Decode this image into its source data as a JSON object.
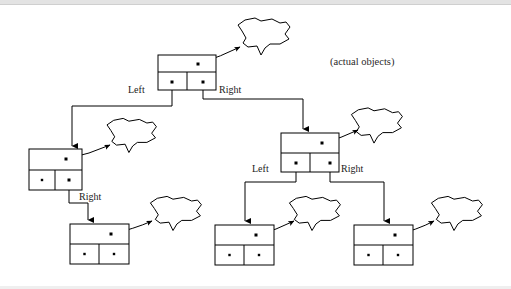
{
  "figure": {
    "caption": "(actual objects)",
    "caption_pos": {
      "x": 330,
      "y": 65
    },
    "colors": {
      "stroke": "#000000",
      "fill": "#ffffff",
      "text": "#1a1a1a",
      "caption": "#2a2a2a",
      "background": "#ffffff"
    },
    "pointer_labels": [
      {
        "id": "root-left",
        "text": "Left",
        "x": 128,
        "y": 93
      },
      {
        "id": "root-right",
        "text": "Right",
        "x": 219,
        "y": 93
      },
      {
        "id": "n2-right",
        "text": "Right",
        "x": 79,
        "y": 200
      },
      {
        "id": "n3-left",
        "text": "Left",
        "x": 252,
        "y": 172
      },
      {
        "id": "n3-right",
        "text": "Right",
        "x": 341,
        "y": 172
      }
    ],
    "nodes": [
      {
        "id": "root",
        "name": "root-node",
        "x": 158,
        "y": 55,
        "w": 58,
        "h": 35,
        "split_y": 72,
        "mid_x": 187,
        "data_dot": {
          "x": 198,
          "y": 64
        },
        "left_dot": {
          "x": 172,
          "y": 82
        },
        "right_dot": {
          "x": 203,
          "y": 82
        },
        "has_left_child": true,
        "has_right_child": true,
        "cells": [
          "",
          ""
        ]
      },
      {
        "id": "n2",
        "name": "left-child-node",
        "x": 29,
        "y": 149,
        "w": 53,
        "h": 41,
        "split_y": 170,
        "mid_x": 55,
        "data_dot": {
          "x": 66,
          "y": 159
        },
        "left_dot": {
          "x": 42,
          "y": 180
        },
        "right_dot": {
          "x": 69,
          "y": 180
        },
        "has_left_child": false,
        "has_right_child": true,
        "cells": [
          "null",
          ""
        ]
      },
      {
        "id": "n3",
        "name": "right-child-node",
        "x": 281,
        "y": 133,
        "w": 58,
        "h": 39,
        "split_y": 153,
        "mid_x": 310,
        "data_dot": {
          "x": 322,
          "y": 143
        },
        "left_dot": {
          "x": 296,
          "y": 163
        },
        "right_dot": {
          "x": 330,
          "y": 163
        },
        "has_left_child": true,
        "has_right_child": true,
        "cells": [
          "",
          ""
        ]
      },
      {
        "id": "n4",
        "name": "leaf-node-left",
        "x": 70,
        "y": 224,
        "w": 59,
        "h": 40,
        "split_y": 244,
        "mid_x": 99,
        "data_dot": {
          "x": 111,
          "y": 234
        },
        "left_dot": null,
        "right_dot": null,
        "has_left_child": false,
        "has_right_child": false,
        "cells": [
          "null",
          "null"
        ]
      },
      {
        "id": "n5",
        "name": "leaf-node-middle",
        "x": 215,
        "y": 225,
        "w": 59,
        "h": 40,
        "split_y": 245,
        "mid_x": 244,
        "data_dot": {
          "x": 256,
          "y": 235
        },
        "left_dot": null,
        "right_dot": null,
        "has_left_child": false,
        "has_right_child": false,
        "cells": [
          "null",
          "null"
        ]
      },
      {
        "id": "n6",
        "name": "leaf-node-right",
        "x": 354,
        "y": 225,
        "w": 59,
        "h": 40,
        "split_y": 245,
        "mid_x": 383,
        "data_dot": {
          "x": 395,
          "y": 235
        },
        "left_dot": null,
        "right_dot": null,
        "has_left_child": false,
        "has_right_child": false,
        "cells": [
          "null",
          "null"
        ]
      }
    ],
    "blobs": [
      {
        "id": "blob-root",
        "name": "object-blob-root",
        "cx": 259,
        "cy": 36,
        "sx": 1.0,
        "sy": 1.0
      },
      {
        "id": "blob-n2",
        "name": "object-blob-left-child",
        "cx": 127,
        "cy": 135,
        "sx": 0.95,
        "sy": 0.92
      },
      {
        "id": "blob-n3",
        "name": "object-blob-right-child",
        "cx": 372,
        "cy": 125,
        "sx": 0.98,
        "sy": 0.95
      },
      {
        "id": "blob-n4",
        "name": "object-blob-leaf-left",
        "cx": 171,
        "cy": 213,
        "sx": 0.98,
        "sy": 0.92
      },
      {
        "id": "blob-n5",
        "name": "object-blob-leaf-middle",
        "cx": 310,
        "cy": 213,
        "sx": 0.98,
        "sy": 0.92
      },
      {
        "id": "blob-n6",
        "name": "object-blob-leaf-right",
        "cx": 452,
        "cy": 213,
        "sx": 0.98,
        "sy": 0.92
      }
    ],
    "edges": [
      {
        "id": "e-root-left",
        "name": "edge-root-to-left-child",
        "points": "172,82 172,106 72,106 72,146"
      },
      {
        "id": "e-root-right",
        "name": "edge-root-to-right-child",
        "points": "203,82 203,99 303,99 303,129"
      },
      {
        "id": "e-n2-right",
        "name": "edge-left-child-to-leaf",
        "points": "69,180 69,203 88,203 88,220"
      },
      {
        "id": "e-n3-left",
        "name": "edge-right-child-to-leaf-middle",
        "points": "296,163 296,182 245,182 245,221"
      },
      {
        "id": "e-n3-right",
        "name": "edge-right-child-to-leaf-right",
        "points": "330,163 330,182 384,182 384,221"
      }
    ],
    "object_arrows": [
      {
        "id": "a-root",
        "name": "arrow-root-to-object",
        "from": [
          198,
          64
        ],
        "ctrl": [
          222,
          56
        ],
        "to": [
          240,
          47
        ]
      },
      {
        "id": "a-n2",
        "name": "arrow-left-child-to-object",
        "from": [
          66,
          159
        ],
        "ctrl": [
          90,
          154
        ],
        "to": [
          110,
          145
        ]
      },
      {
        "id": "a-n3",
        "name": "arrow-right-child-to-object",
        "from": [
          322,
          143
        ],
        "ctrl": [
          342,
          138
        ],
        "to": [
          358,
          130
        ]
      },
      {
        "id": "a-n4",
        "name": "arrow-leaf-left-to-object",
        "from": [
          111,
          234
        ],
        "ctrl": [
          134,
          229
        ],
        "to": [
          152,
          221
        ]
      },
      {
        "id": "a-n5",
        "name": "arrow-leaf-middle-to-object",
        "from": [
          256,
          235
        ],
        "ctrl": [
          277,
          230
        ],
        "to": [
          294,
          221
        ]
      },
      {
        "id": "a-n6",
        "name": "arrow-leaf-right-to-object",
        "from": [
          395,
          235
        ],
        "ctrl": [
          417,
          230
        ],
        "to": [
          434,
          221
        ]
      }
    ]
  }
}
